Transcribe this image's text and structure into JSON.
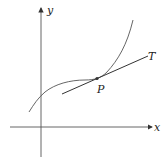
{
  "figure": {
    "axes": {
      "x_label": "x",
      "y_label": "y"
    },
    "curve_label": "",
    "point_label": "P",
    "tangent_label": "T",
    "colors": {
      "ink": "#333333",
      "background": "#ffffff"
    }
  }
}
